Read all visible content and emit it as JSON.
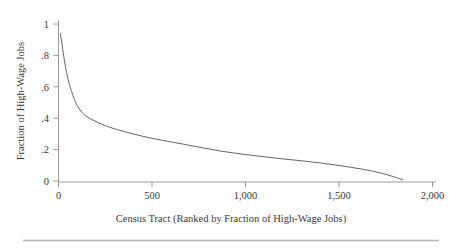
{
  "chart_data": {
    "type": "line",
    "title": "",
    "subtitle": "",
    "xlabel": "Census Tract (Ranked by Fraction of High-Wage Jobs)",
    "ylabel": "Fraction of High-Wage Jobs",
    "xlim": [
      0,
      2000
    ],
    "ylim": [
      0,
      1
    ],
    "grid": false,
    "legend": "none",
    "xticks": [
      0,
      500,
      1000,
      1500,
      2000
    ],
    "xticklabels": [
      "0",
      "500",
      "1,000",
      "1,500",
      "2,000"
    ],
    "yticks": [
      0,
      0.2,
      0.4,
      0.6,
      0.8,
      1
    ],
    "yticklabels": [
      "0",
      ".2",
      ".4",
      ".6",
      ".8",
      "1"
    ],
    "series": [
      {
        "name": "Fraction of High-Wage Jobs",
        "color": "#5b5b5b",
        "x": [
          10,
          20,
          30,
          40,
          55,
          70,
          85,
          100,
          120,
          140,
          165,
          190,
          215,
          245,
          280,
          320,
          360,
          400,
          450,
          500,
          560,
          620,
          680,
          740,
          800,
          870,
          940,
          1010,
          1080,
          1160,
          1240,
          1320,
          1400,
          1480,
          1560,
          1640,
          1720,
          1790,
          1840
        ],
        "y": [
          0.94,
          0.86,
          0.78,
          0.71,
          0.63,
          0.57,
          0.52,
          0.48,
          0.445,
          0.42,
          0.4,
          0.385,
          0.37,
          0.355,
          0.34,
          0.325,
          0.312,
          0.3,
          0.285,
          0.272,
          0.258,
          0.245,
          0.232,
          0.218,
          0.205,
          0.19,
          0.178,
          0.167,
          0.157,
          0.146,
          0.136,
          0.126,
          0.115,
          0.102,
          0.088,
          0.072,
          0.052,
          0.028,
          0.008
        ]
      }
    ]
  },
  "axis_titles": {
    "x": "Census Tract (Ranked by Fraction of High-Wage Jobs)",
    "y": "Fraction of High-Wage Jobs"
  }
}
